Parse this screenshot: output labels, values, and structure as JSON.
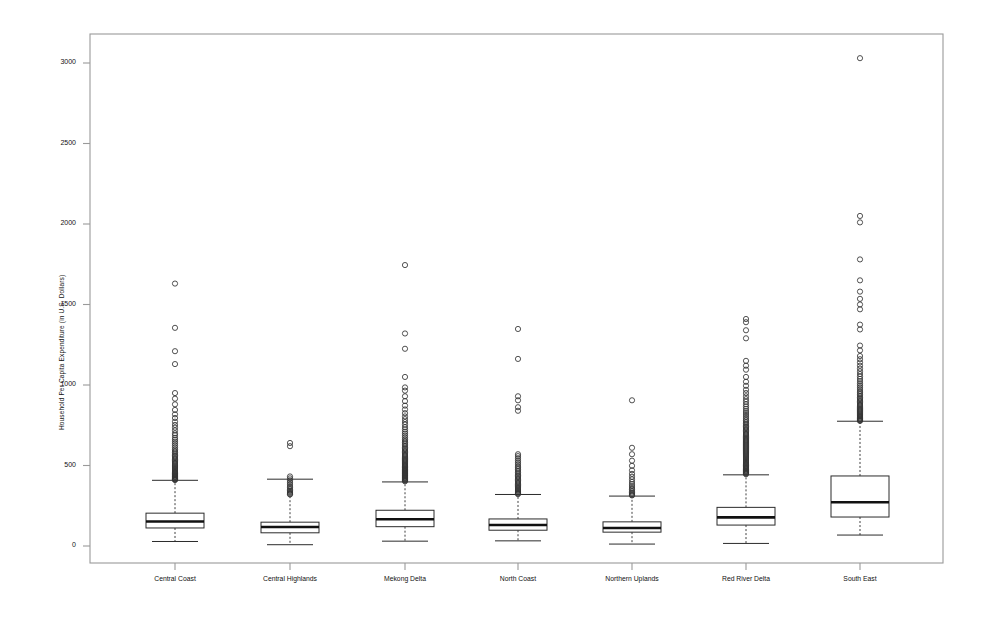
{
  "chart_data": {
    "type": "box",
    "title": "",
    "xlabel": "",
    "ylabel": "Household Per Capita Expenditure (in U.S. Dollars)",
    "ylim": [
      -120,
      3180
    ],
    "yticks": [
      0,
      500,
      1000,
      1500,
      2000,
      2500,
      3000
    ],
    "yticklabels": [
      "0",
      "500",
      "1000",
      "1500",
      "2000",
      "2500",
      "3000"
    ],
    "grid": false,
    "legend": null,
    "categories": [
      "Central Coast",
      "Central Highlands",
      "Mekong Delta",
      "North Coast",
      "Northern Uplands",
      "Red River Delta",
      "South East"
    ],
    "boxes": [
      {
        "name": "Central Coast",
        "whisker_low": 28,
        "q1": 112,
        "median": 152,
        "q3": 204,
        "whisker_high": 408,
        "outliers": [
          1630,
          1355,
          1210,
          1130,
          950,
          915,
          880,
          845,
          818,
          795,
          772,
          752,
          735,
          718,
          700,
          688,
          672,
          660,
          648,
          636,
          624,
          612,
          600,
          590,
          580,
          570,
          562,
          554,
          546,
          538,
          530,
          523,
          516,
          509,
          502,
          496,
          490,
          484,
          478,
          472,
          466,
          460,
          455,
          450,
          445,
          440,
          436,
          432,
          428,
          424,
          420,
          417,
          414,
          412,
          410
        ]
      },
      {
        "name": "Central Highlands",
        "whisker_low": 8,
        "q1": 82,
        "median": 118,
        "q3": 148,
        "whisker_high": 415,
        "outliers": [
          640,
          620,
          432,
          420,
          408,
          396,
          384,
          372,
          362,
          352,
          344,
          336,
          330,
          324,
          320
        ]
      },
      {
        "name": "Mekong Delta",
        "whisker_low": 30,
        "q1": 120,
        "median": 166,
        "q3": 222,
        "whisker_high": 398,
        "outliers": [
          1745,
          1320,
          1225,
          1050,
          985,
          965,
          930,
          900,
          872,
          848,
          825,
          805,
          788,
          770,
          754,
          738,
          724,
          710,
          698,
          686,
          674,
          662,
          652,
          642,
          632,
          622,
          612,
          604,
          596,
          588,
          580,
          572,
          565,
          558,
          551,
          544,
          538,
          532,
          526,
          520,
          514,
          508,
          503,
          498,
          493,
          488,
          483,
          478,
          474,
          470,
          466,
          462,
          458,
          454,
          450,
          446,
          442,
          438,
          434,
          430,
          426,
          422,
          418,
          414,
          410,
          406,
          402
        ]
      },
      {
        "name": "North Coast",
        "whisker_low": 32,
        "q1": 98,
        "median": 130,
        "q3": 168,
        "whisker_high": 320,
        "outliers": [
          1348,
          1162,
          930,
          905,
          862,
          840,
          570,
          558,
          545,
          532,
          520,
          508,
          496,
          486,
          476,
          466,
          456,
          446,
          438,
          430,
          422,
          414,
          406,
          398,
          390,
          382,
          375,
          368,
          361,
          354,
          348,
          342,
          336,
          330,
          326,
          322
        ]
      },
      {
        "name": "Northern Uplands",
        "whisker_low": 12,
        "q1": 86,
        "median": 112,
        "q3": 150,
        "whisker_high": 310,
        "outliers": [
          905,
          610,
          570,
          530,
          498,
          470,
          448,
          430,
          414,
          398,
          384,
          372,
          360,
          350,
          340,
          332,
          324,
          318,
          314
        ]
      },
      {
        "name": "Red River Delta",
        "whisker_low": 16,
        "q1": 130,
        "median": 178,
        "q3": 240,
        "whisker_high": 442,
        "outliers": [
          1410,
          1390,
          1340,
          1290,
          1150,
          1120,
          1095,
          1050,
          1020,
          995,
          970,
          950,
          930,
          912,
          896,
          880,
          866,
          852,
          838,
          826,
          814,
          802,
          790,
          780,
          770,
          760,
          750,
          742,
          734,
          726,
          718,
          710,
          702,
          695,
          688,
          681,
          674,
          667,
          660,
          654,
          648,
          642,
          636,
          630,
          624,
          618,
          612,
          606,
          600,
          594,
          588,
          582,
          576,
          570,
          564,
          558,
          552,
          546,
          540,
          534,
          528,
          522,
          516,
          510,
          505,
          500,
          495,
          490,
          485,
          480,
          475,
          470,
          466,
          462,
          458,
          454,
          450,
          446
        ]
      },
      {
        "name": "South East",
        "whisker_low": 68,
        "q1": 180,
        "median": 272,
        "q3": 435,
        "whisker_high": 775,
        "outliers": [
          3030,
          2050,
          2010,
          1780,
          1650,
          1580,
          1535,
          1500,
          1470,
          1375,
          1345,
          1245,
          1215,
          1180,
          1160,
          1140,
          1120,
          1102,
          1085,
          1068,
          1052,
          1038,
          1024,
          1010,
          998,
          986,
          974,
          962,
          952,
          942,
          932,
          922,
          914,
          906,
          898,
          890,
          882,
          875,
          868,
          861,
          854,
          848,
          842,
          836,
          830,
          824,
          818,
          812,
          807,
          802,
          797,
          792,
          788,
          784,
          780,
          777
        ]
      }
    ]
  },
  "axes": {
    "frame_color": "#9a9a9a",
    "line_color": "#2b2b2b",
    "marker_color": "#333333"
  }
}
